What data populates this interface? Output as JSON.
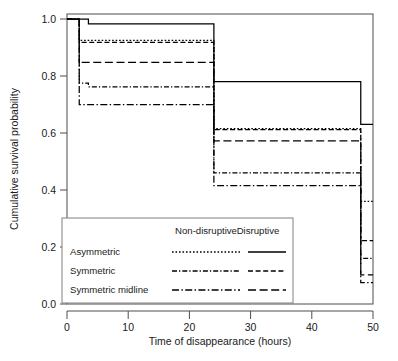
{
  "chart_data": {
    "type": "line",
    "subtype": "kaplan-meier-step",
    "title": "",
    "xlabel": "Time of disappearance (hours)",
    "ylabel": "Cumulative survival probability",
    "xlim": [
      0,
      50
    ],
    "ylim": [
      0.0,
      1.0
    ],
    "xticks": [
      0,
      10,
      20,
      30,
      40,
      50
    ],
    "xtick_labels": [
      "0",
      "10",
      "20",
      "30",
      "40",
      "50"
    ],
    "yticks": [
      0.0,
      0.2,
      0.4,
      0.6,
      0.8,
      1.0
    ],
    "ytick_labels": [
      "0.0",
      "0.2",
      "0.4",
      "0.6",
      "0.8",
      "1.0"
    ],
    "grid": false,
    "legend_position": "bottom-left-inset",
    "step_times": [
      0,
      2,
      24,
      48,
      50
    ],
    "series": [
      {
        "name": "Asymmetric Disruptive",
        "group": "Asymmetric",
        "condition": "Disruptive",
        "style": "solid",
        "x": [
          0,
          2,
          2,
          3.5,
          3.5,
          24,
          24,
          48,
          48,
          50
        ],
        "y": [
          1.0,
          1.0,
          1.0,
          1.0,
          0.983,
          0.983,
          0.78,
          0.78,
          0.63,
          0.63
        ],
        "plateaus": [
          1.0,
          0.983,
          0.78,
          0.63
        ]
      },
      {
        "name": "Asymmetric Non-disruptive",
        "group": "Asymmetric",
        "condition": "Non-disruptive",
        "style": "dotted",
        "x": [
          0,
          2,
          2,
          24,
          24,
          48,
          48,
          50
        ],
        "y": [
          1.0,
          1.0,
          0.925,
          0.925,
          0.615,
          0.615,
          0.36,
          0.36
        ],
        "plateaus": [
          1.0,
          0.925,
          0.615,
          0.36
        ]
      },
      {
        "name": "Symmetric Disruptive",
        "group": "Symmetric",
        "condition": "Disruptive",
        "style": "dashed",
        "x": [
          0,
          2,
          2,
          24,
          24,
          48,
          48,
          50
        ],
        "y": [
          1.0,
          1.0,
          0.918,
          0.918,
          0.612,
          0.612,
          0.222,
          0.222
        ],
        "plateaus": [
          1.0,
          0.918,
          0.612,
          0.222
        ]
      },
      {
        "name": "Symmetric Non-disruptive",
        "group": "Symmetric",
        "condition": "Non-disruptive",
        "style": "dash-dot",
        "x": [
          0,
          2,
          2,
          3.5,
          3.5,
          24,
          24,
          48,
          48,
          50
        ],
        "y": [
          1.0,
          1.0,
          0.775,
          0.775,
          0.762,
          0.762,
          0.46,
          0.46,
          0.16,
          0.16
        ],
        "plateaus": [
          1.0,
          0.775,
          0.762,
          0.46,
          0.16
        ]
      },
      {
        "name": "Symmetric midline Disruptive",
        "group": "Symmetric midline",
        "condition": "Disruptive",
        "style": "long-dash",
        "x": [
          0,
          2,
          2,
          24,
          24,
          48,
          48,
          50
        ],
        "y": [
          1.0,
          1.0,
          0.848,
          0.848,
          0.572,
          0.572,
          0.102,
          0.102
        ],
        "plateaus": [
          1.0,
          0.848,
          0.572,
          0.102
        ]
      },
      {
        "name": "Symmetric midline Non-disruptive",
        "group": "Symmetric midline",
        "condition": "Non-disruptive",
        "style": "long-dash-dot",
        "x": [
          0,
          2,
          2,
          24,
          24,
          48,
          48,
          50
        ],
        "y": [
          1.0,
          1.0,
          0.7,
          0.7,
          0.415,
          0.415,
          0.075,
          0.075
        ],
        "plateaus": [
          1.0,
          0.7,
          0.415,
          0.075
        ]
      }
    ],
    "legend": {
      "columns": [
        "Non-disruptive",
        "Disruptive"
      ],
      "rows": [
        {
          "label": "Asymmetric",
          "non_disruptive_style": "dotted",
          "disruptive_style": "solid"
        },
        {
          "label": "Symmetric",
          "non_disruptive_style": "dash-dot",
          "disruptive_style": "dashed"
        },
        {
          "label": "Symmetric midline",
          "non_disruptive_style": "long-dash-dot",
          "disruptive_style": "long-dash"
        }
      ]
    },
    "colors": {
      "line": "#000000",
      "axis": "#4d4d4d",
      "background": "#ffffff",
      "legend_border": "#808080"
    }
  }
}
